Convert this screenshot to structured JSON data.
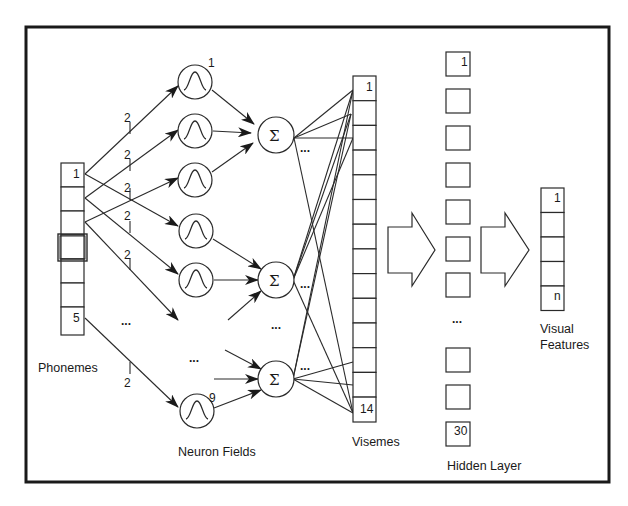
{
  "diagram": {
    "type": "neural-network-architecture",
    "labels": {
      "phonemes": "Phonemes",
      "neuron_fields": "Neuron Fields",
      "visemes": "Visemes",
      "hidden_layer": "Hidden Layer",
      "visual_features_line1": "Visual",
      "visual_features_line2": "Features"
    },
    "phonemes": {
      "first_index": "1",
      "last_index": "5",
      "cells": 7,
      "highlighted_cell": 4
    },
    "neurons": {
      "first_index": "1",
      "last_index": "9",
      "visible_count": 6
    },
    "connection_weight_label": "2",
    "weight_labels": [
      "2",
      "2",
      "2",
      "2",
      "2",
      "2"
    ],
    "summation_symbol": "Σ",
    "summation_nodes": 3,
    "ellipsis": "...",
    "visemes": {
      "first_index": "1",
      "last_index": "14",
      "cells": 14
    },
    "hidden_layer": {
      "first_index": "1",
      "last_index": "30",
      "visible_boxes": 11
    },
    "visual_features": {
      "first_index": "1",
      "last_index": "n",
      "cells": 5
    }
  }
}
